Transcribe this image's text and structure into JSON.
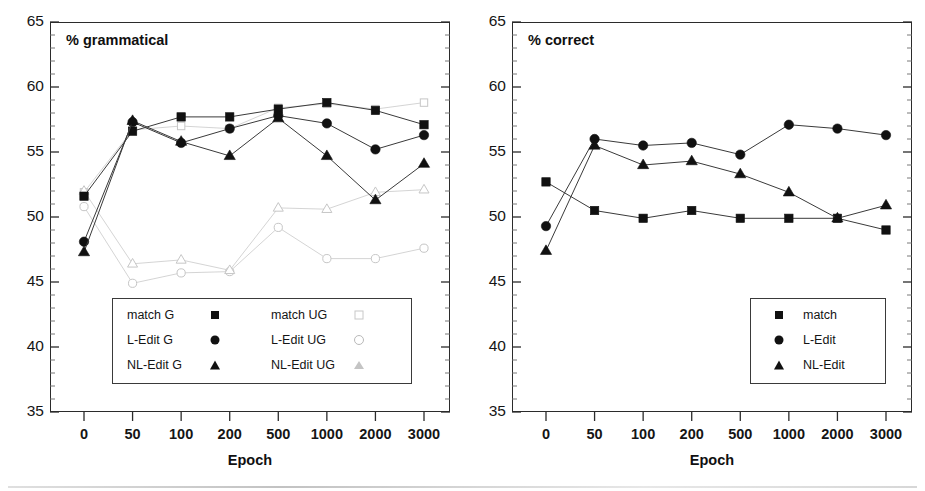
{
  "figure": {
    "width": 925,
    "height": 491,
    "background": "#ffffff",
    "line_color_filled": "#3a3a3a",
    "line_color_open": "#cfcfcf",
    "marker_color_filled": "#111111",
    "marker_color_open": "#c6c6c6"
  },
  "chart_data": [
    {
      "type": "line",
      "panel": "left",
      "title": "% grammatical",
      "xlabel": "Epoch",
      "ylabel": "",
      "categories": [
        "0",
        "50",
        "100",
        "200",
        "500",
        "1000",
        "2000",
        "3000"
      ],
      "ylim": [
        35,
        65
      ],
      "yticks": [
        35,
        40,
        45,
        50,
        55,
        60,
        65
      ],
      "yminor_step": 1,
      "grid": false,
      "legend_position": "lower-left-inside",
      "series": [
        {
          "name": "match G",
          "marker": "square-filled",
          "style": "filled",
          "values": [
            51.6,
            56.6,
            57.7,
            57.7,
            58.3,
            58.8,
            58.2,
            57.1
          ]
        },
        {
          "name": "L-Edit G",
          "marker": "circle-filled",
          "style": "filled",
          "values": [
            48.1,
            57.3,
            55.7,
            56.8,
            57.8,
            57.2,
            55.2,
            56.3
          ]
        },
        {
          "name": "NL-Edit G",
          "marker": "triangle-filled",
          "style": "filled",
          "values": [
            47.3,
            57.4,
            55.8,
            54.7,
            57.6,
            54.7,
            51.3,
            54.1
          ]
        },
        {
          "name": "match UG",
          "marker": "square-open",
          "style": "open",
          "values": [
            51.9,
            56.7,
            57.0,
            56.8,
            58.4,
            58.7,
            58.3,
            58.8
          ]
        },
        {
          "name": "L-Edit UG",
          "marker": "circle-open",
          "style": "open",
          "values": [
            50.8,
            44.9,
            45.7,
            45.8,
            49.2,
            46.8,
            46.8,
            47.6
          ]
        },
        {
          "name": "NL-Edit UG",
          "marker": "triangle-open",
          "style": "open",
          "values": [
            52.0,
            46.4,
            46.7,
            45.9,
            50.7,
            50.6,
            51.9,
            52.1
          ]
        }
      ],
      "legend": [
        {
          "label": "match G",
          "marker": "square-filled"
        },
        {
          "label": "L-Edit G",
          "marker": "circle-filled"
        },
        {
          "label": "NL-Edit G",
          "marker": "triangle-filled"
        },
        {
          "label": "match UG",
          "marker": "square-open"
        },
        {
          "label": "L-Edit UG",
          "marker": "circle-open"
        },
        {
          "label": "NL-Edit UG",
          "marker": "triangle-open"
        }
      ]
    },
    {
      "type": "line",
      "panel": "right",
      "title": "% correct",
      "xlabel": "Epoch",
      "ylabel": "",
      "categories": [
        "0",
        "50",
        "100",
        "200",
        "500",
        "1000",
        "2000",
        "3000"
      ],
      "ylim": [
        35,
        65
      ],
      "yticks": [
        35,
        40,
        45,
        50,
        55,
        60,
        65
      ],
      "yminor_step": 1,
      "grid": false,
      "legend_position": "lower-right-inside",
      "series": [
        {
          "name": "match",
          "marker": "square-filled",
          "style": "filled",
          "values": [
            52.7,
            50.5,
            49.9,
            50.5,
            49.9,
            49.9,
            49.9,
            49.0
          ]
        },
        {
          "name": "L-Edit",
          "marker": "circle-filled",
          "style": "filled",
          "values": [
            49.3,
            56.0,
            55.5,
            55.7,
            54.8,
            57.1,
            56.8,
            56.3
          ]
        },
        {
          "name": "NL-Edit",
          "marker": "triangle-filled",
          "style": "filled",
          "values": [
            47.4,
            55.5,
            54.0,
            54.3,
            53.3,
            51.9,
            49.9,
            50.9
          ]
        }
      ],
      "legend": [
        {
          "label": "match",
          "marker": "square-filled"
        },
        {
          "label": "L-Edit",
          "marker": "circle-filled"
        },
        {
          "label": "NL-Edit",
          "marker": "triangle-filled"
        }
      ]
    }
  ]
}
